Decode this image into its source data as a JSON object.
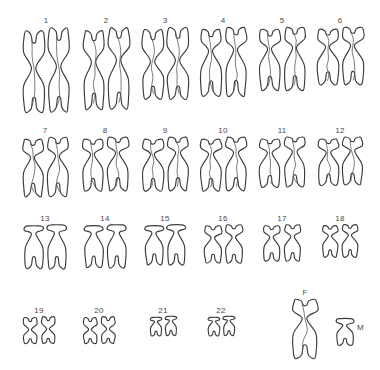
{
  "figure": {
    "kind": "human-karyotype-line-drawing",
    "background_color": "#ffffff",
    "outline_color": "#3b3b3b",
    "label_color": "#4a4a4a",
    "total_labeled_groups": 24
  },
  "rows": [
    {
      "id": "row-1",
      "top": 16,
      "groups": [
        {
          "label": "1",
          "left": 16,
          "pair_height": 88,
          "width": 60,
          "type": "metacentric-large",
          "count": 2
        },
        {
          "label": "2",
          "left": 76,
          "pair_height": 85,
          "width": 60,
          "type": "submetacentric-large",
          "count": 2
        },
        {
          "label": "3",
          "left": 136,
          "pair_height": 75,
          "width": 58,
          "type": "metacentric-large",
          "count": 2
        },
        {
          "label": "4",
          "left": 194,
          "pair_height": 72,
          "width": 58,
          "type": "submetacentric-mid",
          "count": 2
        },
        {
          "label": "5",
          "left": 254,
          "pair_height": 66,
          "width": 56,
          "type": "submetacentric-mid",
          "count": 2
        },
        {
          "label": "6",
          "left": 312,
          "pair_height": 60,
          "width": 56,
          "type": "submetacentric-mid",
          "count": 2
        }
      ]
    },
    {
      "id": "row-2",
      "top": 126,
      "groups": [
        {
          "label": "7",
          "left": 16,
          "pair_height": 62,
          "width": 58,
          "type": "submetacentric-mid",
          "count": 2
        },
        {
          "label": "8",
          "left": 76,
          "pair_height": 56,
          "width": 58,
          "type": "submetacentric-small",
          "count": 2
        },
        {
          "label": "9",
          "left": 136,
          "pair_height": 56,
          "width": 58,
          "type": "submetacentric-small",
          "count": 2
        },
        {
          "label": "10",
          "left": 194,
          "pair_height": 56,
          "width": 58,
          "type": "submetacentric-small",
          "count": 2
        },
        {
          "label": "11",
          "left": 254,
          "pair_height": 52,
          "width": 56,
          "type": "submetacentric-small",
          "count": 2
        },
        {
          "label": "12",
          "left": 312,
          "pair_height": 50,
          "width": 56,
          "type": "submetacentric-small",
          "count": 2
        }
      ]
    },
    {
      "id": "row-3",
      "top": 214,
      "groups": [
        {
          "label": "13",
          "left": 16,
          "pair_height": 46,
          "width": 58,
          "type": "acrocentric-mid",
          "count": 2
        },
        {
          "label": "14",
          "left": 76,
          "pair_height": 45,
          "width": 58,
          "type": "acrocentric-mid",
          "count": 2
        },
        {
          "label": "15",
          "left": 136,
          "pair_height": 42,
          "width": 58,
          "type": "acrocentric-mid",
          "count": 2
        },
        {
          "label": "16",
          "left": 194,
          "pair_height": 40,
          "width": 58,
          "type": "submetacentric-tiny",
          "count": 2
        },
        {
          "label": "17",
          "left": 254,
          "pair_height": 38,
          "width": 56,
          "type": "submetacentric-tiny",
          "count": 2
        },
        {
          "label": "18",
          "left": 312,
          "pair_height": 34,
          "width": 56,
          "type": "submetacentric-tiny",
          "count": 2
        }
      ]
    },
    {
      "id": "row-4",
      "top": 306,
      "groups": [
        {
          "label": "19",
          "left": 10,
          "pair_height": 28,
          "width": 58,
          "type": "metacentric-tiny",
          "count": 2
        },
        {
          "label": "20",
          "left": 70,
          "pair_height": 28,
          "width": 58,
          "type": "metacentric-tiny",
          "count": 2
        },
        {
          "label": "21",
          "left": 134,
          "pair_height": 20,
          "width": 58,
          "type": "acrocentric-tiny",
          "count": 2
        },
        {
          "label": "22",
          "left": 192,
          "pair_height": 20,
          "width": 58,
          "type": "acrocentric-tiny",
          "count": 2
        }
      ]
    }
  ],
  "sex_chromosomes": {
    "x": {
      "label": "F",
      "label_position": "above",
      "left": 292,
      "top": 288,
      "height": 62,
      "width": 26,
      "type": "submetacentric-mid",
      "meaning": "female X chromosome"
    },
    "y": {
      "label": "M",
      "label_position": "right",
      "left": 336,
      "top": 318,
      "height": 28,
      "width": 18,
      "type": "acrocentric-small",
      "meaning": "male Y chromosome"
    }
  }
}
